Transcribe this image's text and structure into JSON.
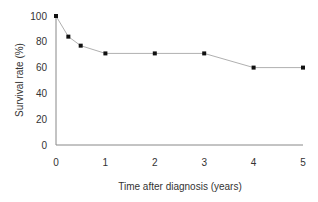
{
  "chart_data": {
    "type": "line",
    "title": "",
    "xlabel": "Time after diagnosis (years)",
    "ylabel": "Survival rate (%)",
    "x": [
      0,
      0.25,
      0.5,
      1,
      2,
      3,
      4,
      5
    ],
    "series": [
      {
        "name": "Survival",
        "values": [
          100,
          84,
          77,
          71,
          71,
          71,
          60,
          60
        ]
      }
    ],
    "xlim": [
      0,
      5
    ],
    "ylim": [
      0,
      100
    ],
    "xticks": [
      0,
      1,
      2,
      3,
      4,
      5
    ],
    "yticks": [
      0,
      20,
      40,
      60,
      80,
      100
    ],
    "grid": false,
    "legend": "none",
    "colors": {
      "line": "#b0b0b0",
      "marker": "#111111",
      "axis": "#888888"
    }
  }
}
